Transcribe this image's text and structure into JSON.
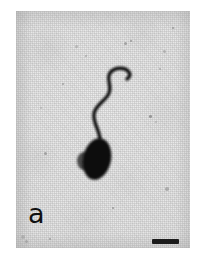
{
  "figure": {
    "panel_label": "a",
    "kind": "light-micrograph",
    "background_color": "#e9e9e9",
    "ink_color": "#0d0d0d",
    "plate": {
      "left": 16,
      "top": 11,
      "width": 174,
      "height": 237
    }
  },
  "cell": {
    "head": {
      "name": "cell-head",
      "center_x": 81,
      "center_y": 148,
      "radius_x": 14,
      "radius_y": 21,
      "rotation_deg": 12,
      "color": "#0d0d0d"
    },
    "flagellum": {
      "name": "flagellum",
      "path": "M 84 128 C 83 118, 77 112, 78 103 C 79 94, 90 90, 93 82 C 96 74, 90 68, 94 62 C 98 56, 108 56, 112 60 C 115 63, 114 66, 111 68",
      "stroke_width": 3.4,
      "color": "#111111"
    }
  },
  "scale_bar": {
    "name": "scale-bar",
    "left": 152,
    "top": 239,
    "width": 27,
    "height": 5,
    "color": "#1b1b1b"
  },
  "specks": [
    {
      "x": 59,
      "y": 34,
      "size": 3.0
    },
    {
      "x": 69,
      "y": 44,
      "size": 2.2
    },
    {
      "x": 108,
      "y": 31,
      "size": 3.4
    },
    {
      "x": 114,
      "y": 29,
      "size": 2.0
    },
    {
      "x": 147,
      "y": 39,
      "size": 2.6
    },
    {
      "x": 143,
      "y": 57,
      "size": 2.4
    },
    {
      "x": 28,
      "y": 141,
      "size": 3.2
    },
    {
      "x": 133,
      "y": 104,
      "size": 2.6
    },
    {
      "x": 139,
      "y": 110,
      "size": 2.2
    },
    {
      "x": 149,
      "y": 176,
      "size": 3.6
    },
    {
      "x": 46,
      "y": 72,
      "size": 2.0
    },
    {
      "x": 96,
      "y": 196,
      "size": 2.2
    },
    {
      "x": 5,
      "y": 224,
      "size": 4.0
    },
    {
      "x": 9,
      "y": 229,
      "size": 3.0
    },
    {
      "x": 33,
      "y": 227,
      "size": 2.2
    },
    {
      "x": 156,
      "y": 16,
      "size": 2.2
    },
    {
      "x": 24,
      "y": 96,
      "size": 2.0
    }
  ]
}
